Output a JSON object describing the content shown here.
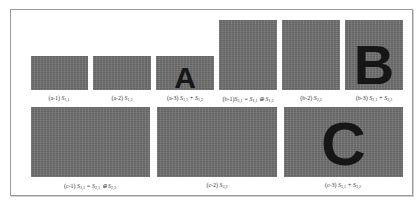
{
  "figure": {
    "colors": {
      "noise_gray": "#707070",
      "letter": "#161616",
      "border": "#9a9a9a"
    },
    "row1": [
      {
        "id": "a-1",
        "tag": "(a-1)",
        "symbol": "S",
        "sub": "1,1",
        "expr": "",
        "letter": ""
      },
      {
        "id": "a-2",
        "tag": "(a-2)",
        "symbol": "S",
        "sub": "1,2",
        "expr": "",
        "letter": ""
      },
      {
        "id": "a-3",
        "tag": "(a-3)",
        "symbol": "S",
        "sub": "1,1",
        "expr": "+ S",
        "expr_sub": "1,2",
        "letter": "A"
      },
      {
        "id": "b-1",
        "tag": "(b-1)",
        "symbol": "S",
        "sub": "2,1",
        "expr": "= S",
        "expr_sub": "1,1",
        "expr2": "⊕ S",
        "expr2_sub": "1,3",
        "letter": ""
      },
      {
        "id": "b-2",
        "tag": "(b-2)",
        "symbol": "S",
        "sub": "2,2",
        "expr": "",
        "letter": ""
      },
      {
        "id": "b-3",
        "tag": "(b-3)",
        "symbol": "S",
        "sub": "2,1",
        "expr": "+ S",
        "expr_sub": "2,2",
        "letter": "B"
      }
    ],
    "row2": [
      {
        "id": "c-1",
        "tag": "(c-1)",
        "symbol": "S",
        "sub": "3,1",
        "expr": "= S",
        "expr_sub": "2,1",
        "expr2": "⊕ S",
        "expr2_sub": "2,3",
        "letter": ""
      },
      {
        "id": "c-2",
        "tag": "(c-2)",
        "symbol": "S",
        "sub": "3,2",
        "expr": "",
        "letter": ""
      },
      {
        "id": "c-3",
        "tag": "(c-3)",
        "symbol": "S",
        "sub": "3,1",
        "expr": "+ S",
        "expr_sub": "3,2",
        "letter": "C"
      }
    ]
  }
}
